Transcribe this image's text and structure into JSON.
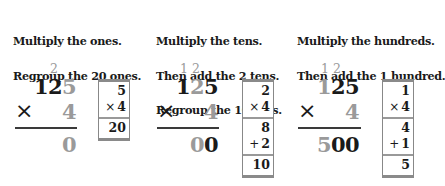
{
  "colors": {
    "text": "#1a1a1a",
    "highlight_gray": "#9a9a9a",
    "box_border": "#8a8a8a"
  },
  "panels": [
    {
      "instructions": [
        "Multiply the ones.",
        "Regroup the 20 ones."
      ],
      "carries": {
        "tens": "2"
      },
      "multiplicand": [
        "1",
        "2",
        "5"
      ],
      "multiplier": "4",
      "times_symbol": "×",
      "product": [
        "",
        "",
        "0"
      ],
      "box": {
        "rows": [
          {
            "a": "5",
            "op": "×",
            "b": "4",
            "result": "20"
          }
        ]
      }
    },
    {
      "instructions": [
        "Multiply the tens.",
        "Then add the 2 tens.",
        "Regroup the 10 tens."
      ],
      "carries": {
        "hundreds": "1",
        "tens": "2"
      },
      "multiplicand": [
        "1",
        "2",
        "5"
      ],
      "multiplier": "4",
      "times_symbol": "×",
      "product": [
        "",
        "0",
        "0"
      ],
      "box": {
        "factor": "2",
        "mult_op": "×",
        "mult_by": "4",
        "partial": "8",
        "add_op": "+",
        "add_val": "2",
        "result": "10"
      }
    },
    {
      "instructions": [
        "Multiply the hundreds.",
        "Then add the 1 hundred."
      ],
      "carries": {
        "hundreds": "1",
        "tens": "2"
      },
      "multiplicand": [
        "1",
        "2",
        "5"
      ],
      "multiplier": "4",
      "times_symbol": "×",
      "product": [
        "5",
        "0",
        "0"
      ],
      "box": {
        "factor": "1",
        "mult_op": "×",
        "mult_by": "4",
        "partial": "4",
        "add_op": "+",
        "add_val": "1",
        "result": "5"
      }
    }
  ]
}
